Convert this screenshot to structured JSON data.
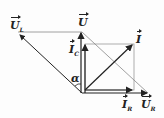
{
  "diagram": {
    "type": "phasor-diagram",
    "labels": {
      "UL": {
        "base": "U",
        "sub": "L"
      },
      "U": {
        "base": "U",
        "sub": ""
      },
      "IC": {
        "base": "I",
        "sub": "C"
      },
      "I": {
        "base": "I",
        "sub": ""
      },
      "IR": {
        "base": "I",
        "sub": "R"
      },
      "UR": {
        "base": "U",
        "sub": "R"
      },
      "alpha": "α"
    },
    "colors": {
      "line": "#222222",
      "thin": "#888888"
    }
  }
}
